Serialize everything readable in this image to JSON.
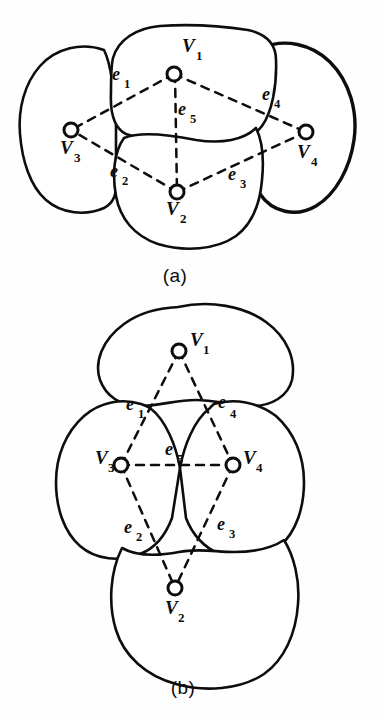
{
  "figure": {
    "panels": [
      {
        "id": "a",
        "caption": "(a)",
        "vertices": [
          {
            "id": "V1",
            "label": "V",
            "sub": "1",
            "cx": 174,
            "cy": 74,
            "label_x": 182,
            "label_y": 52,
            "sub_x": 196,
            "sub_y": 60
          },
          {
            "id": "V2",
            "label": "V",
            "sub": "2",
            "cx": 177,
            "cy": 192,
            "label_x": 166,
            "label_y": 215,
            "sub_x": 180,
            "sub_y": 223
          },
          {
            "id": "V3",
            "label": "V",
            "sub": "3",
            "cx": 71,
            "cy": 130,
            "label_x": 60,
            "label_y": 154,
            "sub_x": 74,
            "sub_y": 162
          },
          {
            "id": "V4",
            "label": "V",
            "sub": "4",
            "cx": 306,
            "cy": 132,
            "label_x": 297,
            "label_y": 158,
            "sub_x": 311,
            "sub_y": 166
          }
        ],
        "edges": [
          {
            "id": "e1",
            "from": "V1",
            "to": "V3",
            "label": "e",
            "sub": "1",
            "label_x": 112,
            "label_y": 80,
            "sub_x": 124,
            "sub_y": 88
          },
          {
            "id": "e2",
            "from": "V2",
            "to": "V3",
            "label": "e",
            "sub": "2",
            "label_x": 110,
            "label_y": 177,
            "sub_x": 122,
            "sub_y": 185
          },
          {
            "id": "e3",
            "from": "V2",
            "to": "V4",
            "label": "e",
            "sub": "3",
            "label_x": 228,
            "label_y": 180,
            "sub_x": 240,
            "sub_y": 188
          },
          {
            "id": "e4",
            "from": "V1",
            "to": "V4",
            "label": "e",
            "sub": "4",
            "label_x": 262,
            "label_y": 100,
            "sub_x": 274,
            "sub_y": 108
          },
          {
            "id": "e5",
            "from": "V1",
            "to": "V2",
            "label": "e",
            "sub": "5",
            "label_x": 178,
            "label_y": 115,
            "sub_x": 190,
            "sub_y": 123
          }
        ],
        "caption_x": 175,
        "caption_y": 282
      },
      {
        "id": "b",
        "caption": "(b)",
        "vertices": [
          {
            "id": "V1",
            "label": "V",
            "sub": "1",
            "cx": 179,
            "cy": 351,
            "label_x": 190,
            "label_y": 346,
            "sub_x": 203,
            "sub_y": 354
          },
          {
            "id": "V2",
            "label": "V",
            "sub": "2",
            "cx": 175,
            "cy": 588,
            "label_x": 165,
            "label_y": 614,
            "sub_x": 178,
            "sub_y": 622
          },
          {
            "id": "V3",
            "label": "V",
            "sub": "3",
            "cx": 121,
            "cy": 465,
            "label_x": 95,
            "label_y": 464,
            "sub_x": 108,
            "sub_y": 472
          },
          {
            "id": "V4",
            "label": "V",
            "sub": "4",
            "cx": 233,
            "cy": 465,
            "label_x": 243,
            "label_y": 464,
            "sub_x": 256,
            "sub_y": 472
          }
        ],
        "edges": [
          {
            "id": "e1",
            "from": "V1",
            "to": "V3",
            "label": "e",
            "sub": "1",
            "label_x": 126,
            "label_y": 410,
            "sub_x": 138,
            "sub_y": 418
          },
          {
            "id": "e2",
            "from": "V3",
            "to": "V2",
            "label": "e",
            "sub": "2",
            "label_x": 124,
            "label_y": 533,
            "sub_x": 136,
            "sub_y": 541
          },
          {
            "id": "e3",
            "from": "V2",
            "to": "V4",
            "label": "e",
            "sub": "3",
            "label_x": 217,
            "label_y": 530,
            "sub_x": 229,
            "sub_y": 538
          },
          {
            "id": "e4",
            "from": "V1",
            "to": "V4",
            "label": "e",
            "sub": "4",
            "label_x": 218,
            "label_y": 408,
            "sub_x": 230,
            "sub_y": 418
          },
          {
            "id": "e5",
            "from": "V3",
            "to": "V4",
            "label": "e",
            "sub": "5",
            "label_x": 165,
            "label_y": 455,
            "sub_x": 177,
            "sub_y": 463
          }
        ],
        "caption_x": 183,
        "caption_y": 694
      }
    ]
  }
}
